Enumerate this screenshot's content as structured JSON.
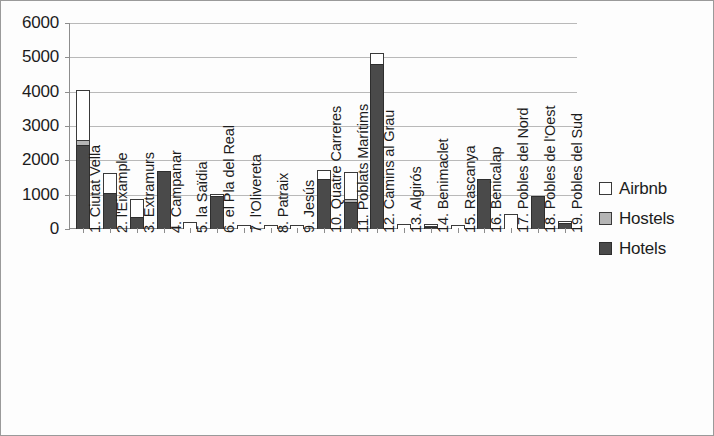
{
  "chart_data": {
    "type": "bar",
    "subtype": "stacked",
    "title": "",
    "xlabel": "",
    "ylabel": "",
    "ylim": [
      0,
      6000
    ],
    "ytick_labels": [
      "0",
      "1000",
      "2000",
      "3000",
      "4000",
      "5000",
      "6000"
    ],
    "ytick_values": [
      0,
      1000,
      2000,
      3000,
      4000,
      5000,
      6000
    ],
    "grid": true,
    "legend_position": "right",
    "categories": [
      "1. Ciutat Vella",
      "2. l'Eixample",
      "3. Extramurs",
      "4. Campanar",
      "5. la Saïdia",
      "6. el Pla del Real",
      "7. l'Olivereta",
      "8. Patraix",
      "9. Jesús",
      "10. Quatre Carreres",
      "11. Poblats Marítims",
      "12. Camins al Grau",
      "13. Algirós",
      "14. Benimaclet",
      "15. Rascanya",
      "16. Benicalap",
      "17. Pobles del Nord",
      "18. Pobles de l'Oest",
      "19. Pobles del Sud"
    ],
    "series": [
      {
        "name": "Hotels",
        "color": "#4a4a4a",
        "values": [
          2450,
          1050,
          350,
          1680,
          0,
          950,
          0,
          0,
          0,
          1450,
          800,
          4800,
          0,
          60,
          0,
          1450,
          0,
          950,
          170
        ]
      },
      {
        "name": "Hostels",
        "color": "#b5b5b5",
        "values": [
          170,
          0,
          0,
          0,
          0,
          0,
          0,
          0,
          0,
          0,
          90,
          0,
          0,
          60,
          0,
          0,
          0,
          0,
          0
        ]
      },
      {
        "name": "Airbnb",
        "color": "#ffffff",
        "values": [
          1480,
          600,
          560,
          40,
          210,
          110,
          130,
          120,
          130,
          300,
          820,
          350,
          150,
          80,
          110,
          30,
          450,
          40,
          80
        ]
      }
    ],
    "totals": [
      4100,
      1650,
      910,
      1720,
      210,
      1060,
      130,
      120,
      130,
      1750,
      1710,
      5150,
      150,
      200,
      110,
      1480,
      450,
      990,
      250
    ]
  },
  "legend": {
    "items": [
      {
        "label": "Airbnb",
        "swatch": "airbnb"
      },
      {
        "label": "Hostels",
        "swatch": "hostels"
      },
      {
        "label": "Hotels",
        "swatch": "hotels"
      }
    ]
  }
}
